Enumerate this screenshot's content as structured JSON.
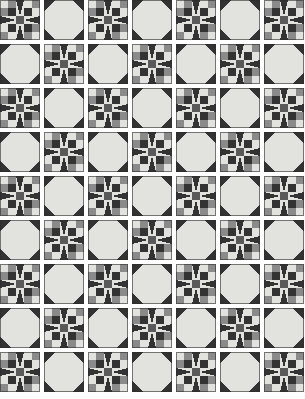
{
  "artwork": {
    "title": "Patchwork Quilt Pattern",
    "description": "Alternating eight-pointed star blocks and snowball octagon blocks arranged in a checkerboard layout",
    "canvas_width": 305,
    "canvas_height": 399,
    "background_color": "#ffffff"
  },
  "grid": {
    "columns": 7,
    "rows": 9,
    "block_size": 40,
    "gap": 4,
    "offset_x": 0,
    "offset_y": 0,
    "alternation": "checkerboard",
    "block_types": [
      "star",
      "snowball"
    ]
  },
  "palette": {
    "dark": "#333333",
    "medium": "#8a8a8a",
    "light": "#e2e2de",
    "background": "#ffffff",
    "outline": "#2b2b2b"
  },
  "blocks": {
    "star": {
      "name": "Eight-Pointed Star Block",
      "center_color": "#5a5a5a",
      "arm_color": "#333333",
      "field_color": "#e2e2de",
      "corner_patch_colors": [
        "#e2e2de",
        "#8a8a8a",
        "#8a8a8a",
        "#e2e2de"
      ],
      "units": 5
    },
    "snowball": {
      "name": "Snowball Octagon Block",
      "octagon_color": "#e2e2de",
      "corner_color": "#333333",
      "units": 5
    }
  },
  "layout_rows": [
    [
      "star",
      "snowball",
      "star",
      "snowball",
      "star",
      "snowball",
      "star"
    ],
    [
      "snowball",
      "star",
      "snowball",
      "star",
      "snowball",
      "star",
      "snowball"
    ],
    [
      "star",
      "snowball",
      "star",
      "snowball",
      "star",
      "snowball",
      "star"
    ],
    [
      "snowball",
      "star",
      "snowball",
      "star",
      "snowball",
      "star",
      "snowball"
    ],
    [
      "star",
      "snowball",
      "star",
      "snowball",
      "star",
      "snowball",
      "star"
    ],
    [
      "snowball",
      "star",
      "snowball",
      "star",
      "snowball",
      "star",
      "snowball"
    ],
    [
      "star",
      "snowball",
      "star",
      "snowball",
      "star",
      "snowball",
      "star"
    ],
    [
      "snowball",
      "star",
      "snowball",
      "star",
      "snowball",
      "star",
      "snowball"
    ],
    [
      "star",
      "snowball",
      "star",
      "snowball",
      "star",
      "snowball",
      "star"
    ]
  ]
}
